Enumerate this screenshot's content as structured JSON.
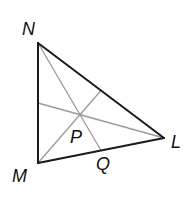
{
  "diagram": {
    "type": "triangle-with-medians",
    "colors": {
      "sides": "#1a1a1a",
      "medians": "#9a9a9a",
      "labels": "#111111",
      "background": "#ffffff"
    },
    "vertices": {
      "N": {
        "label": "N",
        "x": 38,
        "y": 43
      },
      "M": {
        "label": "M",
        "x": 38,
        "y": 163
      },
      "L": {
        "label": "L",
        "x": 164,
        "y": 138
      }
    },
    "points": {
      "P": {
        "label": "P",
        "role": "centroid",
        "x": 80,
        "y": 115
      },
      "Q": {
        "label": "Q",
        "role": "midpoint of ML",
        "x": 101,
        "y": 150.5
      }
    },
    "labels": {
      "N": "N",
      "M": "M",
      "L": "L",
      "P": "P",
      "Q": "Q"
    },
    "segments": {
      "sides": [
        "NM",
        "ML",
        "LN"
      ],
      "medians": [
        "N to midpoint of ML (through Q)",
        "M to midpoint of NL",
        "L to midpoint of NM"
      ]
    }
  }
}
